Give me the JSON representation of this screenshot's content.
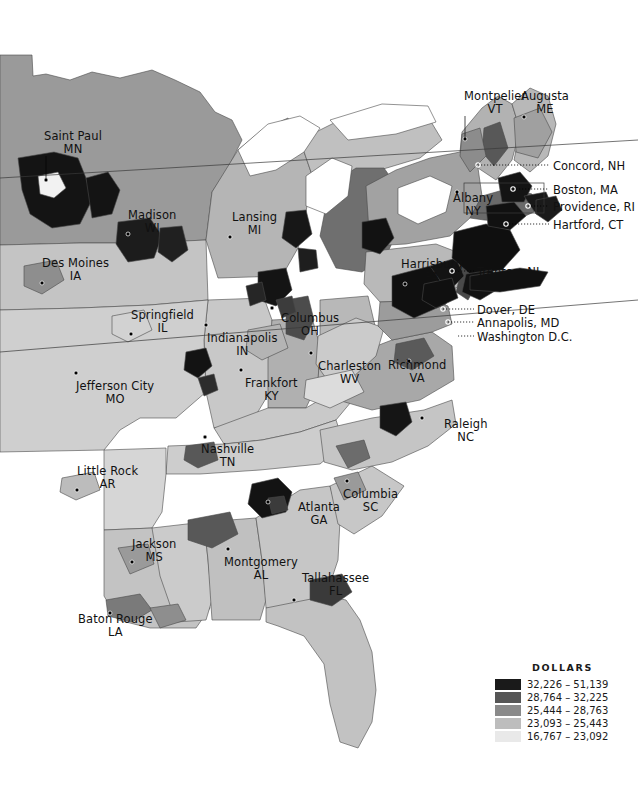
{
  "map": {
    "type": "choropleth",
    "region": "Eastern United States counties",
    "background": "#ffffff",
    "border_color": "#4a4a4a",
    "water_color": "#ffffff"
  },
  "legend": {
    "title": "DOLLARS",
    "classes": [
      {
        "label": "32,226 – 51,139",
        "color": "#1a1a1a",
        "min": 32226,
        "max": 51139
      },
      {
        "label": "28,764 – 32,225",
        "color": "#565656",
        "min": 28764,
        "max": 32225
      },
      {
        "label": "25,444 – 28,763",
        "color": "#8a8a8a",
        "min": 25444,
        "max": 28763
      },
      {
        "label": "23,093 – 25,443",
        "color": "#bdbdbd",
        "min": 23093,
        "max": 25443
      },
      {
        "label": "16,767 – 23,092",
        "color": "#e9e9e9",
        "min": 16767,
        "max": 23092
      }
    ]
  },
  "city_labels": [
    {
      "name": "Saint Paul",
      "state": "MN",
      "x": 44,
      "y": 130,
      "dot_x": 46,
      "dot_y": 180,
      "leader": true
    },
    {
      "name": "Madison",
      "state": "WI",
      "x": 128,
      "y": 209,
      "dot_x": 128,
      "dot_y": 234,
      "leader": false
    },
    {
      "name": "Des Moines",
      "state": "IA",
      "x": 42,
      "y": 257,
      "dot_x": 42,
      "dot_y": 283,
      "leader": false
    },
    {
      "name": "Lansing",
      "state": "MI",
      "x": 232,
      "y": 211,
      "dot_x": 230,
      "dot_y": 237,
      "leader": false
    },
    {
      "name": "Springfield",
      "state": "IL",
      "x": 131,
      "y": 309,
      "dot_x": 131,
      "dot_y": 334,
      "leader": false
    },
    {
      "name": "Indianapolis",
      "state": "IN",
      "x": 207,
      "y": 332,
      "dot_x": 206,
      "dot_y": 325,
      "leader": false
    },
    {
      "name": "Columbus",
      "state": "OH",
      "x": 281,
      "y": 312,
      "dot_x": 272,
      "dot_y": 308,
      "leader": false
    },
    {
      "name": "Jefferson City",
      "state": "MO",
      "x": 76,
      "y": 380,
      "dot_x": 76,
      "dot_y": 373,
      "leader": false
    },
    {
      "name": "Frankfort",
      "state": "KY",
      "x": 245,
      "y": 377,
      "dot_x": 241,
      "dot_y": 370,
      "leader": false
    },
    {
      "name": "Charleston",
      "state": "WV",
      "x": 318,
      "y": 360,
      "dot_x": 311,
      "dot_y": 353,
      "leader": false
    },
    {
      "name": "Richmond",
      "state": "VA",
      "x": 388,
      "y": 359,
      "dot_x": 409,
      "dot_y": 361,
      "leader": false
    },
    {
      "name": "Raleigh",
      "state": "NC",
      "x": 444,
      "y": 418,
      "dot_x": 422,
      "dot_y": 418,
      "leader": false
    },
    {
      "name": "Little Rock",
      "state": "AR",
      "x": 77,
      "y": 465,
      "dot_x": 77,
      "dot_y": 490,
      "leader": false
    },
    {
      "name": "Nashville",
      "state": "TN",
      "x": 201,
      "y": 443,
      "dot_x": 205,
      "dot_y": 437,
      "leader": false
    },
    {
      "name": "Columbia",
      "state": "SC",
      "x": 343,
      "y": 488,
      "dot_x": 347,
      "dot_y": 481,
      "leader": false
    },
    {
      "name": "Atlanta",
      "state": "GA",
      "x": 298,
      "y": 501,
      "dot_x": 268,
      "dot_y": 502,
      "leader": false
    },
    {
      "name": "Jackson",
      "state": "MS",
      "x": 132,
      "y": 538,
      "dot_x": 132,
      "dot_y": 562,
      "leader": false
    },
    {
      "name": "Montgomery",
      "state": "AL",
      "x": 224,
      "y": 556,
      "dot_x": 228,
      "dot_y": 549,
      "leader": false
    },
    {
      "name": "Tallahassee",
      "state": "FL",
      "x": 302,
      "y": 572,
      "dot_x": 294,
      "dot_y": 600,
      "leader": false
    },
    {
      "name": "Baton Rouge",
      "state": "LA",
      "x": 78,
      "y": 613,
      "dot_x": 110,
      "dot_y": 613,
      "leader": false
    },
    {
      "name": "Harrisburg",
      "state": "PA",
      "x": 401,
      "y": 258,
      "dot_x": 405,
      "dot_y": 284,
      "leader": false
    },
    {
      "name": "Albany",
      "state": "NY",
      "x": 453,
      "y": 192,
      "dot_x": 457,
      "dot_y": 192,
      "leader": false
    },
    {
      "name": "Montpelier",
      "state": "VT",
      "x": 464,
      "y": 90,
      "dot_x": 465,
      "dot_y": 139,
      "leader": true
    },
    {
      "name": "Augusta",
      "state": "ME",
      "x": 521,
      "y": 90,
      "dot_x": 524,
      "dot_y": 117,
      "leader": true
    }
  ],
  "callouts": [
    {
      "label": "Concord, NH",
      "text_x": 553,
      "text_y": 160,
      "line_x1": 478,
      "line_y1": 165,
      "line_x2": 549,
      "line_y2": 165,
      "dot_x": 478,
      "dot_y": 165
    },
    {
      "label": "Boston, MA",
      "text_x": 553,
      "text_y": 184,
      "line_x1": 513,
      "line_y1": 189,
      "line_x2": 549,
      "line_y2": 189,
      "dot_x": 513,
      "dot_y": 189
    },
    {
      "label": "Providence, RI",
      "text_x": 553,
      "text_y": 201,
      "line_x1": 528,
      "line_y1": 206,
      "line_x2": 549,
      "line_y2": 206,
      "dot_x": 528,
      "dot_y": 206
    },
    {
      "label": "Hartford, CT",
      "text_x": 553,
      "text_y": 219,
      "line_x1": 506,
      "line_y1": 224,
      "line_x2": 549,
      "line_y2": 224,
      "dot_x": 506,
      "dot_y": 224
    },
    {
      "label": "Trenton, NJ",
      "text_x": 477,
      "text_y": 266,
      "line_x1": 452,
      "line_y1": 271,
      "line_x2": 474,
      "line_y2": 271,
      "dot_x": 452,
      "dot_y": 271
    },
    {
      "label": "Dover, DE",
      "text_x": 477,
      "text_y": 304,
      "line_x1": 443,
      "line_y1": 309,
      "line_x2": 474,
      "line_y2": 309,
      "dot_x": 443,
      "dot_y": 309
    },
    {
      "label": "Annapolis, MD",
      "text_x": 477,
      "text_y": 317,
      "line_x1": 448,
      "line_y1": 322,
      "line_x2": 474,
      "line_y2": 322,
      "dot_x": 448,
      "dot_y": 322
    },
    {
      "label": "Washington D.C.",
      "text_x": 477,
      "text_y": 331,
      "line_x1": 458,
      "line_y1": 336,
      "line_x2": 474,
      "line_y2": 336,
      "dot_x": 458,
      "dot_y": 336
    }
  ],
  "chart_data": {
    "type": "heatmap",
    "title": "DOLLARS",
    "legend_position": "bottom-right",
    "classes": [
      "32,226 – 51,139",
      "28,764 – 32,225",
      "25,444 – 28,763",
      "23,093 – 25,443",
      "16,767 – 23,092"
    ],
    "colors": [
      "#1a1a1a",
      "#565656",
      "#8a8a8a",
      "#bdbdbd",
      "#e9e9e9"
    ],
    "value_range": [
      16767,
      51139
    ],
    "unit": "dollars"
  }
}
